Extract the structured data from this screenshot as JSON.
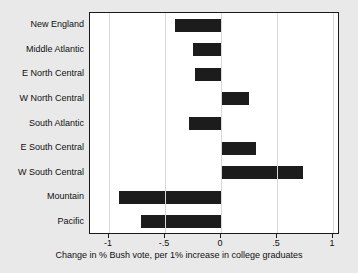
{
  "chart_data": {
    "type": "bar",
    "orientation": "horizontal",
    "title": "",
    "xlabel": "Change in % Bush vote, per 1% increase in college graduates",
    "ylabel": "",
    "categories": [
      "New England",
      "Middle Atlantic",
      "E North Central",
      "W North Central",
      "South Atlantic",
      "E South Central",
      "W South Central",
      "Mountain",
      "Pacific"
    ],
    "values": [
      -0.41,
      -0.25,
      -0.23,
      0.25,
      -0.29,
      0.31,
      0.73,
      -0.91,
      -0.71
    ],
    "xlim": [
      -1.15,
      1.05
    ],
    "xticks": [
      -1,
      -0.5,
      0,
      0.5,
      1
    ],
    "xtick_labels": [
      "-1",
      "-.5",
      "0",
      ".5",
      "1"
    ],
    "grid": true,
    "grid_axis": "x",
    "legend": null,
    "bar_color": "#1c1c1c",
    "background_color": "#e9e9e9",
    "plot_background_color": "#ffffff"
  }
}
